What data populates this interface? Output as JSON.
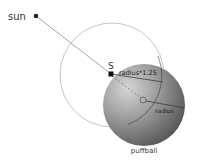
{
  "diagram": {
    "labels": {
      "sun": "sun",
      "s_point": "S",
      "radius_scaled": "radius*1.25",
      "radius": "radius",
      "puffball": "puffball"
    },
    "colors": {
      "background": "#ffffff",
      "outline_circle": "#bdbdbd",
      "sun_line": "#9a9a9a",
      "point": "#222222",
      "sphere_light": "#d2d2d2",
      "sphere_mid": "#8a8a8a",
      "sphere_dark": "#4a4a4a",
      "inner_line": "#3a3a3a"
    },
    "geometry": {
      "sun": {
        "x": 36,
        "y": 16
      },
      "s_point": {
        "x": 111,
        "y": 74
      },
      "outline_circle": {
        "cx": 112,
        "cy": 75,
        "r": 52
      },
      "puffball_sphere": {
        "cx": 144,
        "cy": 105,
        "r": 41
      },
      "small_circle": {
        "cx": 143,
        "cy": 100,
        "r": 3
      }
    }
  }
}
